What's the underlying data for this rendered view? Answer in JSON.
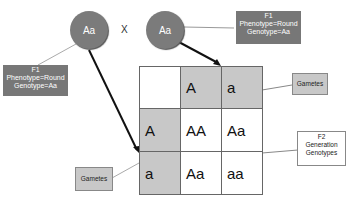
{
  "parents": [
    {
      "genotype": "Aa"
    },
    {
      "genotype": "Aa"
    }
  ],
  "cross_symbol": "X",
  "f1_label_left": {
    "title": "F1",
    "phenotype": "Phenotype=Round",
    "genotype": "Genotype=Aa"
  },
  "f1_label_right": {
    "title": "F1",
    "phenotype": "Phenotype=Round",
    "genotype": "Genotype=Aa"
  },
  "punnett": {
    "top_gametes": [
      "A",
      "a"
    ],
    "side_gametes": [
      "A",
      "a"
    ],
    "cells": [
      [
        "AA",
        "Aa"
      ],
      [
        "Aa",
        "aa"
      ]
    ]
  },
  "callouts": {
    "gametes_top": "Gametes",
    "gametes_left": "Gametes",
    "f2_line1": "F2",
    "f2_line2": "Generation",
    "f2_line3": "Genotypes"
  },
  "colors": {
    "circle": "#7b7b7b",
    "label_dark": "#777777",
    "gamete_cell": "#c8c8c8"
  }
}
